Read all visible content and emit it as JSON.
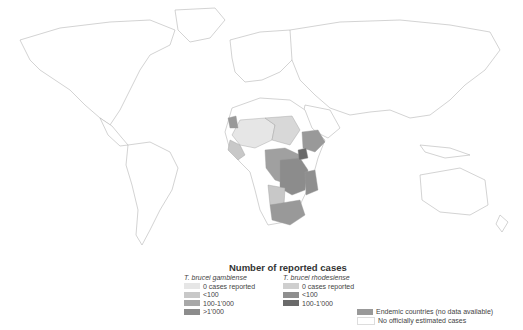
{
  "legend": {
    "title": "Number of reported cases",
    "gambiense": {
      "header": "T. brucei gambiense",
      "items": [
        {
          "label": "0 cases reported",
          "color": "#e6e6e6"
        },
        {
          "label": "<100",
          "color": "#c8c8c8"
        },
        {
          "label": "100-1'000",
          "color": "#a8a8a8"
        },
        {
          "label": ">1'000",
          "color": "#8c8c8c"
        }
      ]
    },
    "rhodesiense": {
      "header": "T. brucei rhodesiense",
      "items": [
        {
          "label": "0 cases reported",
          "color": "#cfcfcf"
        },
        {
          "label": "<100",
          "color": "#8f8f8f"
        },
        {
          "label": "100-1'000",
          "color": "#6a6a6a"
        }
      ]
    },
    "other": [
      {
        "label": "Endemic countries (no data available)",
        "color": "#999999"
      },
      {
        "label": "No officially estimated cases",
        "color": "#ffffff"
      }
    ]
  },
  "map": {
    "border_color": "#b0b0b0",
    "land_color": "#ffffff"
  }
}
